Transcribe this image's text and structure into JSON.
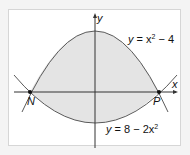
{
  "diagram": {
    "axes": {
      "x_label": "x",
      "y_label": "y"
    },
    "curves": [
      {
        "label_y": "y",
        "label_eq": " = x",
        "label_sup": "2",
        "label_rest": " − 4"
      },
      {
        "label_y": "y",
        "label_eq": " = 8 − 2x",
        "label_sup": "2",
        "label_rest": ""
      }
    ],
    "points": [
      {
        "label": "N"
      },
      {
        "label": "P"
      }
    ],
    "colors": {
      "shade": "#e4e4e4",
      "curve": "#5a5a5a",
      "axis": "#333333"
    }
  }
}
